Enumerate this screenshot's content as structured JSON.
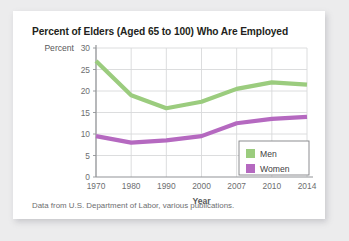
{
  "figure": {
    "title": "Percent of Elders (Aged 65 to 100) Who Are Employed",
    "source_note": "Data from U.S. Department of Labor, various publications.",
    "card_background": "#ffffff",
    "page_background": "#ececed"
  },
  "chart_data": {
    "type": "line",
    "title": "Percent of Elders (Aged 65 to 100) Who Are Employed",
    "xlabel": "Year",
    "ylabel": "Percent",
    "categories": [
      "1970",
      "1980",
      "1990",
      "2000",
      "2007",
      "2010",
      "2014"
    ],
    "yticks": [
      "0",
      "5",
      "10",
      "15",
      "20",
      "25",
      "30"
    ],
    "ylim": [
      0,
      30
    ],
    "grid": true,
    "legend_position": "bottom-right",
    "series": [
      {
        "name": "Men",
        "color": "#9bcc7e",
        "values": [
          27,
          19,
          16,
          17.5,
          20.5,
          22,
          21.5
        ]
      },
      {
        "name": "Women",
        "color": "#b569c0",
        "values": [
          9.5,
          8,
          8.5,
          9.5,
          12.5,
          13.5,
          14
        ]
      }
    ]
  },
  "axes": {
    "y_axis_title": "Percent",
    "x_axis_title": "Year"
  },
  "legend": {
    "entries": [
      {
        "label": "Men",
        "color": "#9bcc7e"
      },
      {
        "label": "Women",
        "color": "#b569c0"
      }
    ]
  },
  "colors": {
    "men": "#9bcc7e",
    "women": "#b569c0",
    "grid": "#d8d9da",
    "axis": "#929497",
    "text": "#6d6e70"
  }
}
